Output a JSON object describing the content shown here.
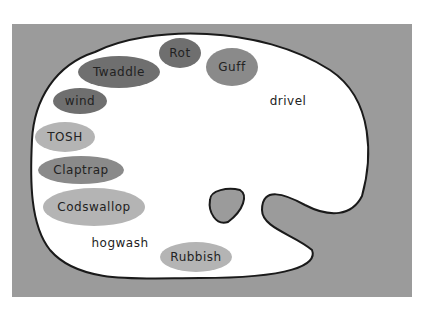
{
  "diagram": {
    "type": "artist-palette",
    "background_color": "#9b9b9b",
    "palette_color": "#ffffff",
    "blobs": [
      {
        "label": "Rot",
        "shade": "dark"
      },
      {
        "label": "Guff",
        "shade": "mid"
      },
      {
        "label": "Twaddle",
        "shade": "dark"
      },
      {
        "label": "drivel",
        "shade": "white"
      },
      {
        "label": "wind",
        "shade": "dark"
      },
      {
        "label": "TOSH",
        "shade": "light"
      },
      {
        "label": "Claptrap",
        "shade": "mid"
      },
      {
        "label": "Codswallop",
        "shade": "light"
      },
      {
        "label": "hogwash",
        "shade": "white"
      },
      {
        "label": "Rubbish",
        "shade": "light"
      }
    ]
  }
}
